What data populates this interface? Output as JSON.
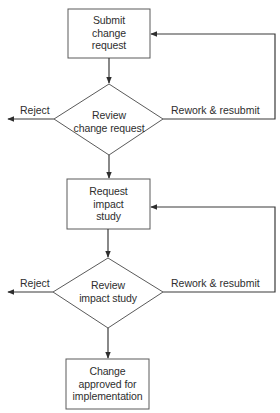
{
  "diagram": {
    "type": "flowchart",
    "nodes": [
      {
        "id": "submit",
        "shape": "process",
        "label_lines": [
          "Submit",
          "change",
          "request"
        ]
      },
      {
        "id": "review_cr",
        "shape": "decision",
        "label_lines": [
          "Review",
          "change request"
        ]
      },
      {
        "id": "impact",
        "shape": "process",
        "label_lines": [
          "Request",
          "impact",
          "study"
        ]
      },
      {
        "id": "review_is",
        "shape": "decision",
        "label_lines": [
          "Review",
          "impact study"
        ]
      },
      {
        "id": "approved",
        "shape": "process",
        "label_lines": [
          "Change",
          "approved for",
          "implementation"
        ]
      }
    ],
    "edges": [
      {
        "from": "submit",
        "to": "review_cr",
        "label": ""
      },
      {
        "from": "review_cr",
        "to": "exit_left_1",
        "label": "Reject"
      },
      {
        "from": "review_cr",
        "to": "submit",
        "label": "Rework & resubmit"
      },
      {
        "from": "review_cr",
        "to": "impact",
        "label": ""
      },
      {
        "from": "impact",
        "to": "review_is",
        "label": ""
      },
      {
        "from": "review_is",
        "to": "exit_left_2",
        "label": "Reject"
      },
      {
        "from": "review_is",
        "to": "impact",
        "label": "Rework & resubmit"
      },
      {
        "from": "review_is",
        "to": "approved",
        "label": ""
      }
    ],
    "labels": {
      "reject_1": "Reject",
      "rework_1": "Rework & resubmit",
      "reject_2": "Reject",
      "rework_2": "Rework & resubmit"
    }
  }
}
